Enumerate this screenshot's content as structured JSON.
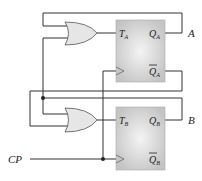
{
  "diagram": {
    "title": "",
    "flipflops": [
      {
        "id": "A",
        "input_label": "T",
        "input_sub": "A",
        "q_label": "Q",
        "q_sub": "A",
        "qbar_label": "Q",
        "qbar_sub": "A"
      },
      {
        "id": "B",
        "input_label": "T",
        "input_sub": "B",
        "q_label": "Q",
        "q_sub": "B",
        "qbar_label": "Q",
        "qbar_sub": "B"
      }
    ],
    "outputs": {
      "a": "A",
      "b": "B"
    },
    "clock_label": "CP",
    "colors": {
      "box": "#c8c8c8",
      "box_center": "#f2f2f2",
      "gate": "#e6e6e6",
      "wire": "#333333"
    }
  }
}
